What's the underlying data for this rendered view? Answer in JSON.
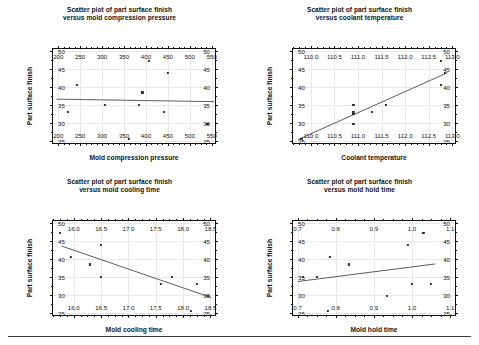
{
  "page": {
    "footer_rule": true
  },
  "shared": {
    "ylabel": "Part surface finish",
    "yticks": [
      25,
      30,
      35,
      40,
      45,
      50
    ],
    "ylim": [
      23.8,
      50.6
    ],
    "response_values": [
      33.0,
      40.6,
      35.1,
      25.4,
      35.1,
      38.5,
      47.3,
      33.0,
      44.0,
      29.7
    ]
  },
  "charts": [
    {
      "id": "compression-pressure",
      "title_line1": "Scatter plot of part surface finish",
      "title_line2": "versus mold compression pressure",
      "xlabel": "Mold compression pressure",
      "ylabel": "Part surface finish",
      "xticks": [
        200,
        250,
        300,
        350,
        400,
        450,
        500,
        550
      ],
      "xticklabels": [
        "200",
        "250",
        "300",
        "350",
        "400",
        "450",
        "500",
        "550"
      ],
      "xlim": [
        188,
        562
      ],
      "yticks": [
        25,
        30,
        35,
        40,
        45,
        50
      ],
      "yticklabels": [
        "25",
        "30",
        "35",
        "40",
        "45",
        "50"
      ],
      "ylim": [
        23.8,
        50.6
      ]
    },
    {
      "id": "coolant-temperature",
      "title_line1": "Scatter plot of part surface finish",
      "title_line2": "versus coolant temperature",
      "xlabel": "Coolant temperature",
      "ylabel": "Part surface finish",
      "xticks": [
        110.0,
        110.5,
        111.0,
        111.5,
        112.0,
        112.5,
        113.0
      ],
      "xticklabels": [
        "110.0",
        "110.5",
        "111.0",
        "111.5",
        "112.0",
        "112.5",
        "113.0"
      ],
      "xlim": [
        109.62,
        113.1
      ],
      "yticks": [
        25,
        30,
        35,
        40,
        45,
        50
      ],
      "yticklabels": [
        "25",
        "30",
        "35",
        "40",
        "45",
        "50"
      ],
      "ylim": [
        23.8,
        50.6
      ]
    },
    {
      "id": "mold-cooling-time",
      "title_line1": "Scatter plot of part surface finish",
      "title_line2": "versus mold cooling time",
      "xlabel": "Mold cooling time",
      "ylabel": "Part surface finish",
      "xticks": [
        16.0,
        16.5,
        17.0,
        17.5,
        18.0,
        18.5
      ],
      "xticklabels": [
        "16.0",
        "16.5",
        "17.0",
        "17.5",
        "18.0",
        "18.5"
      ],
      "xlim": [
        15.62,
        18.62
      ],
      "yticks": [
        25,
        30,
        35,
        40,
        45,
        50
      ],
      "yticklabels": [
        "25",
        "30",
        "35",
        "40",
        "45",
        "50"
      ],
      "ylim": [
        23.8,
        50.6
      ]
    },
    {
      "id": "mold-hold-time",
      "title_line1": "Scatter plot of part surface finish",
      "title_line2": "versus mold hold time",
      "xlabel": "Mold hold time",
      "ylabel": "Part surface finish",
      "xticks": [
        0.7,
        0.8,
        0.9,
        1.0,
        1.1
      ],
      "xticklabels": [
        "0.7",
        "0.8",
        "0.9",
        "1.0",
        "1.1"
      ],
      "xlim": [
        0.688,
        1.118
      ],
      "yticks": [
        25,
        30,
        35,
        40,
        45,
        50
      ],
      "yticklabels": [
        "25",
        "30",
        "35",
        "40",
        "45",
        "50"
      ],
      "ylim": [
        23.8,
        50.6
      ]
    }
  ],
  "chart_data": [
    {
      "type": "scatter",
      "title": "Scatter plot of part surface finish versus mold compression pressure",
      "xlabel": "Mold compression pressure",
      "ylabel": "Part surface finish",
      "xlim": [
        188,
        562
      ],
      "ylim": [
        23.8,
        50.6
      ],
      "xticks": [
        200,
        250,
        300,
        350,
        400,
        450,
        500,
        550
      ],
      "yticks": [
        25,
        30,
        35,
        40,
        45,
        50
      ],
      "grid": true,
      "legend": "none",
      "x": [
        222,
        242,
        307,
        362,
        384,
        392,
        407,
        441,
        450,
        540
      ],
      "y": [
        33.0,
        40.6,
        35.1,
        25.4,
        35.1,
        38.5,
        47.3,
        33.0,
        44.0,
        29.7
      ],
      "fit_line": {
        "x": [
          196,
          556
        ],
        "y": [
          36.6,
          35.9
        ],
        "note": "near-flat least-squares fit"
      }
    },
    {
      "type": "scatter",
      "title": "Scatter plot of part surface finish versus coolant temperature",
      "xlabel": "Coolant temperature",
      "ylabel": "Part surface finish",
      "xlim": [
        109.62,
        113.1
      ],
      "ylim": [
        23.8,
        50.6
      ],
      "xticks": [
        110.0,
        110.5,
        111.0,
        111.5,
        112.0,
        112.5,
        113.0
      ],
      "yticks": [
        25,
        30,
        35,
        40,
        45,
        50
      ],
      "grid": true,
      "legend": "none",
      "x": [
        109.8,
        110.9,
        110.9,
        110.9,
        110.9,
        111.3,
        111.6,
        112.75,
        112.75,
        112.85
      ],
      "y": [
        25.4,
        35.1,
        33.0,
        32.4,
        29.7,
        33.0,
        35.1,
        47.3,
        40.6,
        44.0
      ],
      "fit_line": {
        "x": [
          109.72,
          112.9
        ],
        "y": [
          25.3,
          44.0
        ],
        "note": "strong positive trend"
      }
    },
    {
      "type": "scatter",
      "title": "Scatter plot of part surface finish versus mold cooling time",
      "xlabel": "Mold cooling time",
      "ylabel": "Part surface finish",
      "xlim": [
        15.62,
        18.62
      ],
      "ylim": [
        23.8,
        50.6
      ],
      "xticks": [
        16.0,
        16.5,
        17.0,
        17.5,
        18.0,
        18.5
      ],
      "yticks": [
        25,
        30,
        35,
        40,
        45,
        50
      ],
      "grid": true,
      "legend": "none",
      "x": [
        15.75,
        15.95,
        16.3,
        16.5,
        16.5,
        17.6,
        17.8,
        18.15,
        18.25,
        18.45
      ],
      "y": [
        47.3,
        40.6,
        38.5,
        44.0,
        35.1,
        33.0,
        35.1,
        25.4,
        33.0,
        29.7
      ],
      "fit_line": {
        "x": [
          15.78,
          18.52
        ],
        "y": [
          43.6,
          29.2
        ],
        "note": "negative trend"
      }
    },
    {
      "type": "scatter",
      "title": "Scatter plot of part surface finish versus mold hold time",
      "xlabel": "Mold hold time",
      "ylabel": "Part surface finish",
      "xlim": [
        0.688,
        1.118
      ],
      "ylim": [
        23.8,
        50.6
      ],
      "xticks": [
        0.7,
        0.8,
        0.9,
        1.0,
        1.1
      ],
      "yticks": [
        25,
        30,
        35,
        40,
        45,
        50
      ],
      "grid": true,
      "legend": "none",
      "x": [
        0.715,
        0.75,
        0.78,
        0.785,
        0.835,
        0.935,
        0.99,
        1.0,
        1.03,
        1.05
      ],
      "y": [
        35.1,
        35.1,
        25.4,
        40.6,
        38.5,
        29.7,
        44.0,
        33.0,
        47.3,
        33.0
      ],
      "fit_line": {
        "x": [
          0.7,
          1.06
        ],
        "y": [
          33.7,
          38.6
        ],
        "note": "weak positive trend"
      }
    }
  ]
}
